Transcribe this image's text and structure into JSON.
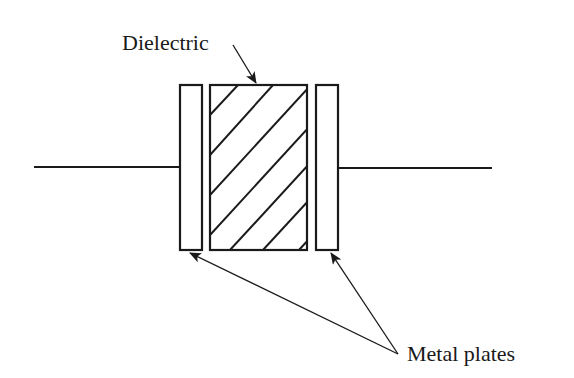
{
  "diagram": {
    "labels": {
      "dielectric": "Dielectric",
      "metal_plates": "Metal plates"
    },
    "components": [
      {
        "name": "left-lead-wire",
        "type": "wire"
      },
      {
        "name": "left-metal-plate",
        "type": "plate"
      },
      {
        "name": "dielectric",
        "type": "hatched-block"
      },
      {
        "name": "right-metal-plate",
        "type": "plate"
      },
      {
        "name": "right-lead-wire",
        "type": "wire"
      }
    ],
    "colors": {
      "stroke": "#1a1a1a",
      "background": "#ffffff"
    }
  }
}
